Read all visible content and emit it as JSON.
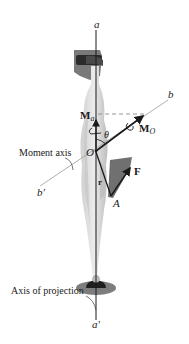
{
  "figure": {
    "type": "moment about an axis diagram",
    "labels": {
      "axis_a_top": "a",
      "axis_a_bottom": "a'",
      "axis_b": "b",
      "axis_b_prime": "b'",
      "moment_axis": "Moment axis",
      "axis_of_projection": "Axis of projection",
      "Ma_main": "M",
      "Ma_sub": "a",
      "Mo_main": "M",
      "Mo_sub": "O",
      "origin": "O",
      "theta": "θ",
      "force": "F",
      "position_vector": "r",
      "point_A": "A"
    },
    "colors": {
      "lines": "#1a1a1a",
      "dashed": "#8a8a8a",
      "body_light": "#d9d9d9",
      "body_mid": "#bdbdbd",
      "body_dark": "#6e6e6e",
      "force_patch": "#707070"
    }
  }
}
